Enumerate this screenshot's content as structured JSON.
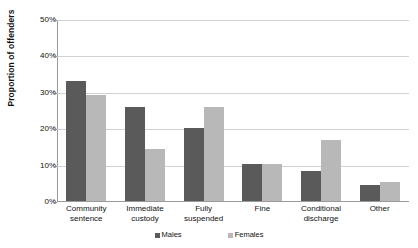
{
  "chart_data": {
    "type": "bar",
    "title": "",
    "subtitle": "",
    "xlabel": "",
    "ylabel": "Proportion of offenders",
    "ylim": [
      0,
      50
    ],
    "ytick_labels": [
      "0%",
      "10%",
      "20%",
      "30%",
      "40%",
      "50%"
    ],
    "ytick_values": [
      0,
      10,
      20,
      30,
      40,
      50
    ],
    "grid": true,
    "legend_position": "bottom",
    "categories": [
      "Community sentence",
      "Immediate custody",
      "Fully suspended",
      "Fine",
      "Conditional discharge",
      "Other"
    ],
    "category_lines": [
      [
        "Community",
        "sentence"
      ],
      [
        "Immediate",
        "custody"
      ],
      [
        "Fully",
        "suspended"
      ],
      [
        "Fine",
        ""
      ],
      [
        "Conditional",
        "discharge"
      ],
      [
        "Other",
        ""
      ]
    ],
    "series": [
      {
        "name": "Males",
        "color": "#5a5a5a",
        "values": [
          33.0,
          25.8,
          20.0,
          10.3,
          8.3,
          4.4
        ]
      },
      {
        "name": "Females",
        "color": "#b8b8b8",
        "values": [
          29.2,
          14.4,
          25.8,
          10.3,
          16.7,
          5.3
        ]
      }
    ]
  },
  "colors": {
    "series_males": "#5a5a5a",
    "series_females": "#b8b8b8",
    "gridline": "#d2d2d2",
    "axis": "#9a9a9a",
    "text": "#111111",
    "background": "#ffffff"
  },
  "legend": {
    "items": [
      {
        "label": "Males",
        "color": "#5a5a5a"
      },
      {
        "label": "Females",
        "color": "#b8b8b8"
      }
    ]
  }
}
